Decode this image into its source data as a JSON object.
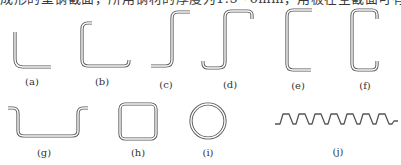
{
  "caption_fragment": "成形的型钢截面，所用钢材的厚度为1.5~6mm，用板在全截面可有",
  "shapes": [
    {
      "id": "a",
      "label": "(a)",
      "name": "angle-section"
    },
    {
      "id": "b",
      "label": "(b)",
      "name": "lipped-angle-section"
    },
    {
      "id": "c",
      "label": "(c)",
      "name": "z-section"
    },
    {
      "id": "d",
      "label": "(d)",
      "name": "lipped-z-section"
    },
    {
      "id": "e",
      "label": "(e)",
      "name": "channel-section"
    },
    {
      "id": "f",
      "label": "(f)",
      "name": "lipped-channel-section"
    },
    {
      "id": "g",
      "label": "(g)",
      "name": "hat-section"
    },
    {
      "id": "h",
      "label": "(h)",
      "name": "square-tube-section"
    },
    {
      "id": "i",
      "label": "(i)",
      "name": "circular-tube-section"
    },
    {
      "id": "j",
      "label": "(j)",
      "name": "corrugated-sheet-section"
    }
  ],
  "colors": {
    "stroke": "#555555",
    "background": "#ffffff",
    "text": "#333333"
  }
}
